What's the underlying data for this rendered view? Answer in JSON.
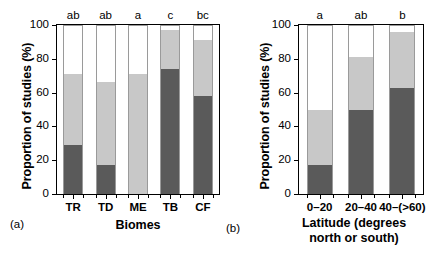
{
  "figure": {
    "background": "#ffffff",
    "colors": {
      "segment_dark": "#5a5a5a",
      "segment_light": "#c8c8c8",
      "segment_white": "#ffffff",
      "axis": "#000000"
    }
  },
  "panels": [
    {
      "tag": "(a)",
      "ylabel": "Proportion of studies (%)",
      "xlabel": "Biomes",
      "xlabel_line2": "",
      "yticks": [
        0,
        20,
        40,
        60,
        80,
        100
      ],
      "ylim": [
        0,
        100
      ]
    },
    {
      "tag": "(b)",
      "ylabel": "Proportion of studies (%)",
      "xlabel": "Latitude (degrees",
      "xlabel_line2": "north or south)",
      "yticks": [
        0,
        20,
        40,
        60,
        80,
        100
      ],
      "ylim": [
        0,
        100
      ]
    }
  ],
  "chart_data": [
    {
      "type": "bar",
      "stacked": true,
      "panel": "(a)",
      "title": "",
      "xlabel": "Biomes",
      "ylabel": "Proportion of studies (%)",
      "ylim": [
        0,
        100
      ],
      "yticks": [
        0,
        20,
        40,
        60,
        80,
        100
      ],
      "grid": false,
      "legend": "none",
      "categories": [
        "TR",
        "TD",
        "ME",
        "TB",
        "CF"
      ],
      "annotations": [
        "ab",
        "ab",
        "a",
        "c",
        "bc"
      ],
      "series": [
        {
          "name": "dark",
          "color": "#5a5a5a",
          "values": [
            29,
            17,
            0,
            74,
            58
          ]
        },
        {
          "name": "light",
          "color": "#c8c8c8",
          "values": [
            42,
            49,
            71,
            23,
            33
          ]
        },
        {
          "name": "white",
          "color": "#ffffff",
          "values": [
            29,
            34,
            29,
            3,
            9
          ]
        }
      ],
      "cumulative_tops": {
        "dark": [
          29,
          17,
          0,
          74,
          58
        ],
        "light": [
          71,
          66,
          71,
          97,
          91
        ]
      }
    },
    {
      "type": "bar",
      "stacked": true,
      "panel": "(b)",
      "title": "",
      "xlabel": "Latitude (degrees north or south)",
      "ylabel": "Proportion of studies (%)",
      "ylim": [
        0,
        100
      ],
      "yticks": [
        0,
        20,
        40,
        60,
        80,
        100
      ],
      "grid": false,
      "legend": "none",
      "categories": [
        "0–20",
        "20–40",
        "40–(>60)"
      ],
      "annotations": [
        "a",
        "ab",
        "b"
      ],
      "series": [
        {
          "name": "dark",
          "color": "#5a5a5a",
          "values": [
            17,
            50,
            63
          ]
        },
        {
          "name": "light",
          "color": "#c8c8c8",
          "values": [
            33,
            31,
            33
          ]
        },
        {
          "name": "white",
          "color": "#ffffff",
          "values": [
            50,
            19,
            4
          ]
        }
      ],
      "cumulative_tops": {
        "dark": [
          17,
          50,
          63
        ],
        "light": [
          50,
          81,
          96
        ]
      }
    }
  ]
}
